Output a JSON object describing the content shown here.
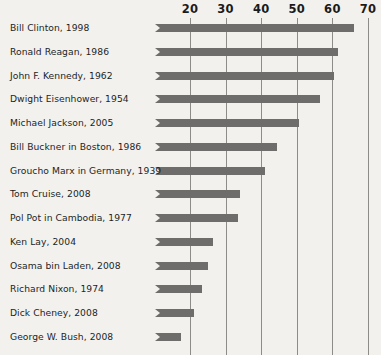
{
  "chart_data": {
    "type": "bar",
    "orientation": "horizontal",
    "title": "",
    "subtitle": "",
    "xlabel": "",
    "ylabel": "",
    "xlim": [
      14,
      71
    ],
    "xticks": [
      20,
      30,
      40,
      50,
      60,
      70
    ],
    "xtick_labels": [
      "20",
      "30",
      "40",
      "50",
      "60",
      "70"
    ],
    "grid": "vertical",
    "legend": "none",
    "bar_color": "#6e6d6b",
    "background_color": "#f2f1ee",
    "gridline_color": "#8d8c89",
    "categories": [
      "Bill Clinton, 1998",
      "Ronald Reagan, 1986",
      "John F. Kennedy, 1962",
      "Dwight Eisenhower, 1954",
      "Michael Jackson, 2005",
      "Bill Buckner in Boston, 1986",
      "Groucho Marx in Germany, 1939",
      "Tom Cruise, 2008",
      "Pol Pot in Cambodia, 1977",
      "Ken Lay, 2004",
      "Osama bin Laden, 2008",
      "Richard Nixon, 1974",
      "Dick Cheney, 2008",
      "George W. Bush, 2008"
    ],
    "values": [
      66,
      61.5,
      60.5,
      56.5,
      50.5,
      44.5,
      41,
      34,
      33.5,
      26.5,
      25,
      23.5,
      21,
      17.5
    ],
    "bars": [
      {
        "label": "Bill Clinton, 1998",
        "value": 66
      },
      {
        "label": "Ronald Reagan, 1986",
        "value": 61.5
      },
      {
        "label": "John F. Kennedy, 1962",
        "value": 60.5
      },
      {
        "label": "Dwight Eisenhower, 1954",
        "value": 56.5
      },
      {
        "label": "Michael Jackson, 2005",
        "value": 50.5
      },
      {
        "label": "Bill Buckner in Boston, 1986",
        "value": 44.5
      },
      {
        "label": "Groucho Marx in Germany, 1939",
        "value": 41
      },
      {
        "label": "Tom Cruise, 2008",
        "value": 34
      },
      {
        "label": "Pol Pot in Cambodia, 1977",
        "value": 33.5
      },
      {
        "label": "Ken Lay, 2004",
        "value": 26.5
      },
      {
        "label": "Osama bin Laden, 2008",
        "value": 25
      },
      {
        "label": "Richard Nixon, 1974",
        "value": 23.5
      },
      {
        "label": "Dick Cheney, 2008",
        "value": 21
      },
      {
        "label": "George W. Bush, 2008",
        "value": 17.5
      }
    ]
  }
}
